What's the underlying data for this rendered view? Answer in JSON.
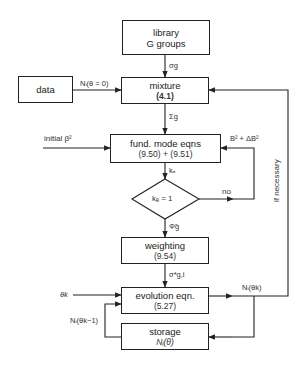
{
  "nodes": {
    "library": {
      "line1": "library",
      "line2": "G groups"
    },
    "data": {
      "label": "data"
    },
    "mixture": {
      "title": "mixture",
      "ref": "(4.1)"
    },
    "fund": {
      "title": "fund. mode eqns",
      "ref": "(9.50) + (9.51)"
    },
    "decision": {
      "label": "kₑ = 1"
    },
    "weighting": {
      "title": "weighting",
      "ref": "(9.54)"
    },
    "evolution": {
      "title": "evolution eqn.",
      "ref": "(5.27)"
    },
    "storage": {
      "title": "storage",
      "ref": "Nᵢ(θ)"
    }
  },
  "edges": {
    "library_to_mixture": "σg",
    "data_to_mixture": "Nᵢ(θ = 0)",
    "mixture_to_fund": "Σg",
    "initial": "initial β²",
    "buckling_update": "B² + ΔB²",
    "fund_to_decision": "kₑ",
    "no": "no",
    "decision_to_weighting": "Φ̃g",
    "weighting_to_evolution": "σ*g,i",
    "theta_k": "θk",
    "evolution_out": "Nᵢ(θk)",
    "storage_back": "Nᵢ(θk−1)",
    "if_necessary": "if necessary"
  }
}
